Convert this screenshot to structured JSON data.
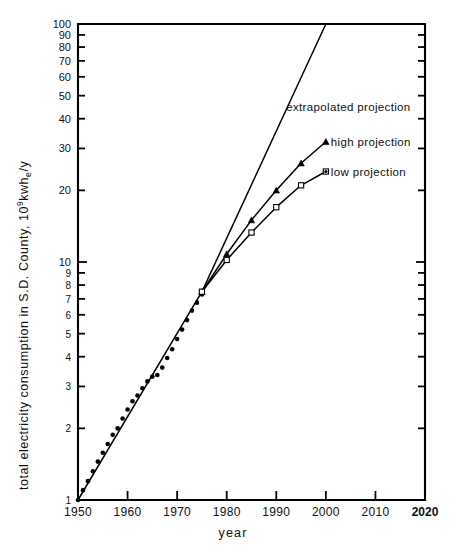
{
  "chart_data": {
    "type": "line",
    "title": "",
    "xlabel": "year",
    "ylabel": "total electricity consumption in S.D. County, 10⁹kwhₑ/y",
    "ylabel_parts": {
      "lead": "total electricity consumption in S.D. County, 10",
      "sup": "9",
      "mid": "kwh",
      "sub": "e",
      "tail": "/y"
    },
    "xlim": [
      1950,
      2020
    ],
    "ylim": [
      1,
      100
    ],
    "yscale": "log",
    "xscale": "linear",
    "grid": false,
    "legend_position": "inline-annotations",
    "xticks": [
      1950,
      1960,
      1970,
      1980,
      1990,
      2000,
      2010,
      2020
    ],
    "xticklabels": [
      "1950",
      "1960",
      "1970",
      "1980",
      "1990",
      "2000",
      "2010",
      "2020"
    ],
    "yticks": [
      1,
      2,
      3,
      4,
      5,
      6,
      7,
      8,
      9,
      10,
      20,
      30,
      40,
      50,
      60,
      70,
      80,
      90,
      100
    ],
    "yticklabels": [
      "1",
      "2",
      "3",
      "4",
      "5",
      "6",
      "7",
      "8",
      "9",
      "10",
      "20",
      "30",
      "40",
      "50",
      "60",
      "70",
      "80",
      "90",
      "100"
    ],
    "annotations": [
      {
        "text": "extrapolated projection",
        "x": 1992,
        "y": 45
      },
      {
        "text": "high projection",
        "x": 2001,
        "y": 32
      },
      {
        "text": "low projection",
        "x": 2001,
        "y": 24
      }
    ],
    "series": [
      {
        "name": "historical data",
        "marker": "filled-circle",
        "line": false,
        "x": [
          1950,
          1951,
          1952,
          1953,
          1954,
          1955,
          1956,
          1957,
          1958,
          1959,
          1960,
          1961,
          1962,
          1963,
          1964,
          1965,
          1966,
          1967,
          1968,
          1969,
          1970,
          1971,
          1972,
          1973,
          1974,
          1975
        ],
        "y": [
          1.0,
          1.1,
          1.2,
          1.32,
          1.45,
          1.58,
          1.72,
          1.88,
          2.0,
          2.2,
          2.4,
          2.6,
          2.75,
          2.95,
          3.15,
          3.3,
          3.35,
          3.6,
          3.95,
          4.3,
          4.75,
          5.2,
          5.7,
          6.25,
          6.75,
          7.3
        ]
      },
      {
        "name": "fitted historical trend",
        "marker": "none",
        "line": true,
        "x": [
          1950,
          1975
        ],
        "y": [
          1.0,
          7.5
        ]
      },
      {
        "name": "extrapolated projection",
        "marker": "none",
        "line": true,
        "x": [
          1975,
          2000
        ],
        "y": [
          7.5,
          100
        ]
      },
      {
        "name": "high projection",
        "marker": "filled-triangle",
        "line": true,
        "x": [
          1975,
          1980,
          1985,
          1990,
          1995,
          2000
        ],
        "y": [
          7.5,
          10.8,
          15.0,
          20.0,
          26.0,
          32.0
        ]
      },
      {
        "name": "low projection",
        "marker": "open-square",
        "line": true,
        "x": [
          1975,
          1980,
          1985,
          1990,
          1995,
          2000
        ],
        "y": [
          7.5,
          10.2,
          13.3,
          17.0,
          21.0,
          24.0
        ]
      }
    ]
  },
  "axis": {
    "x_label_text": "year"
  }
}
